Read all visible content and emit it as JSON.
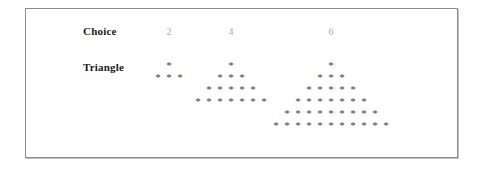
{
  "panel": {
    "border_color": "#8d8f91",
    "background_color": "#ffffff"
  },
  "rows": {
    "choice_label": "Choice",
    "triangle_label": "Triangle"
  },
  "columns": [
    {
      "header": "2"
    },
    {
      "header": "4"
    },
    {
      "header": "6"
    }
  ],
  "star_glyph": "*",
  "text_colors": {
    "label": "#1b1b1b",
    "header": "#a9abad",
    "star": "#3f3f3f"
  },
  "chart_data": {
    "type": "table",
    "title": "",
    "xlabel": "",
    "ylabel": "",
    "categories": [
      "2",
      "4",
      "6"
    ],
    "series": [
      {
        "name": "Choice",
        "values": [
          2,
          4,
          6
        ]
      },
      {
        "name": "Triangle rows",
        "values": [
          2,
          4,
          6
        ]
      }
    ],
    "triangles": [
      {
        "choice": 2,
        "rows": 2,
        "row_star_counts": [
          1,
          3
        ],
        "total_stars": 4
      },
      {
        "choice": 4,
        "rows": 4,
        "row_star_counts": [
          1,
          3,
          5,
          7
        ],
        "total_stars": 16
      },
      {
        "choice": 6,
        "rows": 6,
        "row_star_counts": [
          1,
          3,
          5,
          7,
          9,
          11
        ],
        "total_stars": 36
      }
    ]
  }
}
